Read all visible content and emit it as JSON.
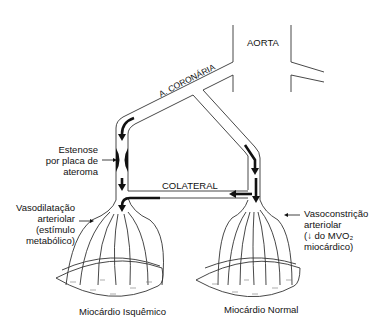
{
  "diagram": {
    "labels": {
      "aorta": "AORTA",
      "coronary": "A. CORONÁRIA",
      "collateral": "COLATERAL",
      "stenosis": [
        "Estenose",
        "por placa de",
        "ateroma"
      ],
      "vasodilation": [
        "Vasodilatação",
        "arteriolar",
        "(estímulo",
        "metabólico)"
      ],
      "vasoconstriction": [
        "Vasoconstrição",
        "arteriolar",
        "(↓ do MVO₂",
        "miocárdico)"
      ],
      "ischemic_myocardium": "Miocárdio Isquêmico",
      "normal_myocardium": "Miocárdio Normal"
    },
    "colors": {
      "line": "#333333",
      "arrow": "#111111",
      "background": "#ffffff"
    }
  }
}
